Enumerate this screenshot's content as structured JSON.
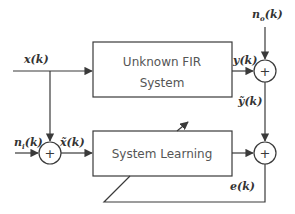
{
  "diagram": {
    "type": "adaptive system identification block diagram",
    "blocks": {
      "unknown_system": {
        "line1": "Unknown FIR",
        "line2": "System"
      },
      "learning_system": {
        "label": "System Learning"
      }
    },
    "signals": {
      "input": "x(k)",
      "output_noise_base": "n",
      "output_noise_sub": "o",
      "output_noise_tail": "(k)",
      "input_noise_base": "n",
      "input_noise_sub": "i",
      "input_noise_tail": "(k)",
      "noisy_input": "x̃(k)",
      "system_output": "y(k)",
      "noisy_output": "ỹ(k)",
      "error": "e(k)"
    },
    "summing_junctions": {
      "output_noise_sum": "+",
      "input_noise_sum": "+",
      "error_sum": "+"
    },
    "colors": {
      "line": "#3a3a3a",
      "text": "#333333",
      "box_text": "#555555",
      "background": "#ffffff"
    }
  }
}
